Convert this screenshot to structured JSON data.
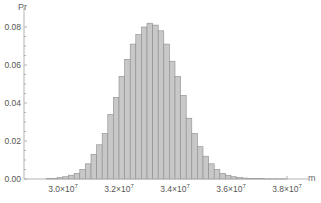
{
  "chart_data": {
    "type": "bar",
    "title": "",
    "xlabel": "m",
    "ylabel": "Pr",
    "xlim": [
      29000000,
      38500000
    ],
    "ylim": [
      0,
      0.088
    ],
    "x_ticks": [
      30000000,
      32000000,
      34000000,
      36000000,
      38000000
    ],
    "x_tick_labels": [
      "3.0×10⁷",
      "3.2×10⁷",
      "3.4×10⁷",
      "3.6×10⁷",
      "3.8×10⁷"
    ],
    "y_ticks": [
      0.0,
      0.02,
      0.04,
      0.06,
      0.08
    ],
    "y_tick_labels": [
      "0.00",
      "0.02",
      "0.04",
      "0.06",
      "0.08"
    ],
    "grid": false,
    "legend": null,
    "bin_width": 200000,
    "bin_starts": [
      29400000,
      29600000,
      29800000,
      30000000,
      30200000,
      30400000,
      30600000,
      30800000,
      31000000,
      31200000,
      31400000,
      31600000,
      31800000,
      32000000,
      32200000,
      32400000,
      32600000,
      32800000,
      33000000,
      33200000,
      33400000,
      33600000,
      33800000,
      34000000,
      34200000,
      34400000,
      34600000,
      34800000,
      35000000,
      35200000,
      35400000,
      35600000,
      35800000,
      36000000,
      36200000,
      36400000,
      36600000,
      36800000,
      37000000,
      37200000,
      37400000,
      37600000,
      37800000
    ],
    "values": [
      0.0002,
      0.0004,
      0.0007,
      0.0012,
      0.002,
      0.003,
      0.005,
      0.008,
      0.013,
      0.018,
      0.024,
      0.034,
      0.043,
      0.054,
      0.063,
      0.071,
      0.076,
      0.08,
      0.082,
      0.081,
      0.078,
      0.071,
      0.062,
      0.054,
      0.044,
      0.032,
      0.024,
      0.017,
      0.012,
      0.008,
      0.005,
      0.003,
      0.002,
      0.0012,
      0.0008,
      0.0005,
      0.0003,
      0.0002,
      0.0002,
      0.0001,
      0.0001,
      0.0001,
      0.0001
    ]
  },
  "axes": {
    "y_label": "Pr",
    "x_label": "m"
  },
  "colors": {
    "bar_fill": "#c8c8c8",
    "bar_edge": "#8c8c8c",
    "axis": "#b3b3b3",
    "text": "#555555"
  }
}
